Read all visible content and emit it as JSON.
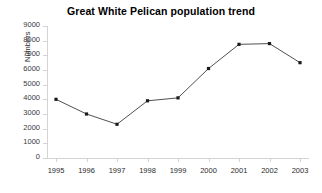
{
  "chart_data": {
    "type": "line",
    "title": "Great White Pelican population trend",
    "xlabel": "",
    "ylabel": "Numbers",
    "categories": [
      "1995",
      "1996",
      "1997",
      "1998",
      "1999",
      "2000",
      "2001",
      "2002",
      "2003"
    ],
    "series": [
      {
        "name": "Great White Pelican population",
        "values": [
          4000,
          3000,
          2300,
          3900,
          4100,
          6100,
          7750,
          7800,
          6500
        ]
      }
    ],
    "ylim": [
      0,
      9000
    ],
    "y_ticks": [
      0,
      1000,
      2000,
      3000,
      4000,
      5000,
      6000,
      7000,
      8000,
      9000
    ],
    "y_tick_labels": [
      "0",
      "1000",
      "2000",
      "3000",
      "4000",
      "5000",
      "6000",
      "7000",
      "8000",
      "9000"
    ],
    "grid": false,
    "legend": false,
    "legend_position": "none",
    "line_color": "#3c3c3c",
    "marker": "square",
    "marker_color": "#1a1a1a",
    "axis_color": "#d4d4d4",
    "background_color": "#ffffff"
  }
}
